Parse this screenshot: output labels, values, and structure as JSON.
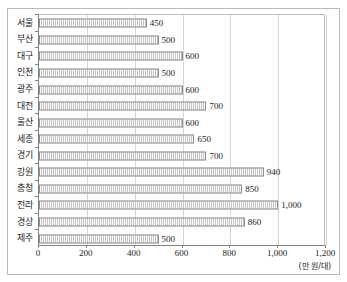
{
  "figure": {
    "title_partial": "",
    "unit_label": "(만 원/대)"
  },
  "chart_data": {
    "type": "bar",
    "orientation": "horizontal",
    "title": "",
    "xlabel": "(만 원/대)",
    "ylabel": "",
    "xlim": [
      0,
      1200
    ],
    "xticks": [
      0,
      200,
      400,
      600,
      800,
      1000,
      1200
    ],
    "xticklabels": [
      "0",
      "200",
      "400",
      "600",
      "800",
      "1,000",
      "1,200"
    ],
    "grid": true,
    "grid_axis": "x",
    "legend": false,
    "categories": [
      "서울",
      "부산",
      "대구",
      "인천",
      "광주",
      "대전",
      "울산",
      "세종",
      "경기",
      "강원",
      "충청",
      "전라",
      "경상",
      "제주"
    ],
    "values": [
      450,
      500,
      600,
      500,
      600,
      700,
      600,
      650,
      700,
      940,
      850,
      1000,
      860,
      500
    ],
    "datalabels": [
      "450",
      "500",
      "600",
      "500",
      "600",
      "700",
      "600",
      "650",
      "700",
      "940",
      "850",
      "1,000",
      "860",
      "500"
    ],
    "bar_color": "#e4e4e4",
    "bar_edge_color": "#8d8d8d",
    "grid_color": "#d6d6d6",
    "axis_color": "#808080"
  }
}
